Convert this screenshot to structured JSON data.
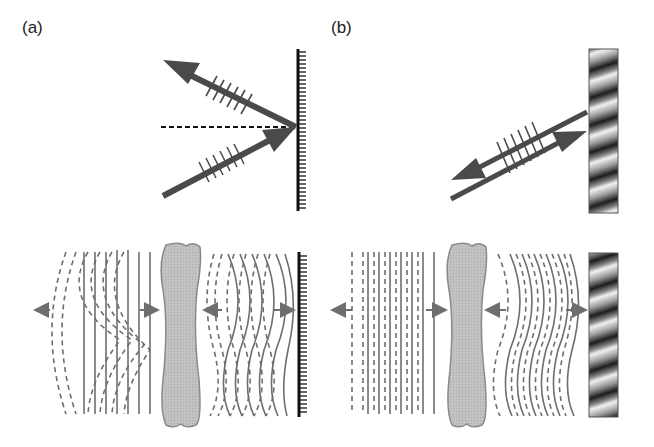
{
  "figure": {
    "panels": [
      {
        "label": "(a)",
        "mirror_type": "ordinary-mirror",
        "description": "Ordinary mirror: reflected ray leaves at equal angle; wavefront distortion from aberrator is doubled on return."
      },
      {
        "label": "(b)",
        "mirror_type": "phase-conjugate-mirror",
        "description": "Phase-conjugate mirror: reflected ray retraces incident path; distortion is undone after second pass through aberrator."
      }
    ],
    "colors": {
      "arrow": "#4a4a4a",
      "wavefront": "#6e6e6e",
      "aberrator_fill": "#bdbdbd",
      "aberrator_stroke": "#8a8a8a",
      "mirror": "#111111",
      "background": "#ffffff"
    }
  }
}
